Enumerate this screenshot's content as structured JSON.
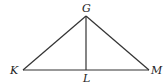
{
  "diagram": {
    "type": "triangle",
    "points": {
      "G": {
        "label": "G",
        "x": 86,
        "y": 16
      },
      "K": {
        "label": "K",
        "x": 23,
        "y": 70
      },
      "L": {
        "label": "L",
        "x": 86,
        "y": 70
      },
      "M": {
        "label": "M",
        "x": 149,
        "y": 70
      }
    },
    "segments": [
      "GK",
      "GM",
      "KM",
      "GL"
    ]
  }
}
